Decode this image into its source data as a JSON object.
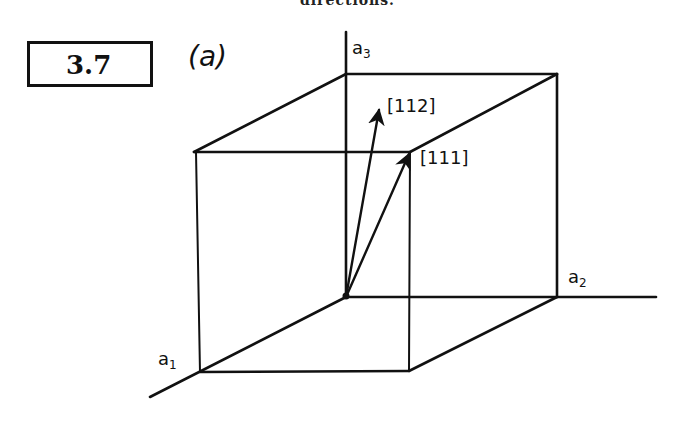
{
  "page": {
    "top_caption": "directions."
  },
  "problem": {
    "number": "3.7",
    "part": "(a)"
  },
  "axes": {
    "a1": {
      "base": "a",
      "sub": "1"
    },
    "a2": {
      "base": "a",
      "sub": "2"
    },
    "a3": {
      "base": "a",
      "sub": "3"
    }
  },
  "directions": [
    {
      "label": "[112]"
    },
    {
      "label": "[111]"
    }
  ],
  "colors": {
    "ink": "#111111",
    "paper": "#ffffff"
  }
}
